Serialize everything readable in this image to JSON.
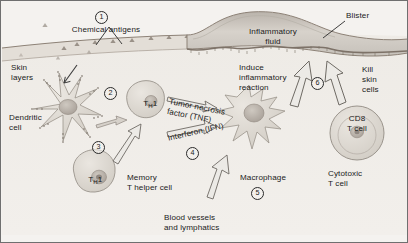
{
  "figure": {
    "background_color": "#f4f2ef",
    "frame_color": "#6f6f6f"
  },
  "markers": [
    {
      "id": "marker-1",
      "label": "1"
    },
    {
      "id": "marker-2",
      "label": "2"
    },
    {
      "id": "marker-3",
      "label": "3"
    },
    {
      "id": "marker-4",
      "label": "4"
    },
    {
      "id": "marker-5",
      "label": "5"
    },
    {
      "id": "marker-6",
      "label": "6"
    }
  ],
  "labels": {
    "chemical_antigens": "Chemical antigens",
    "skin_layers_l1": "Skin",
    "skin_layers_l2": "layers",
    "dendritic_cell_l1": "Dendritic",
    "dendritic_cell_l2": "cell",
    "th1_cell_upper": "T",
    "th1_cell_upper_sub": "H",
    "th1_cell_upper_num": "1",
    "th1_cell_lower": "T",
    "th1_cell_lower_sub": "H",
    "th1_cell_lower_num": "1",
    "memory_t_helper_l1": "Memory",
    "memory_t_helper_l2": "T helper cell",
    "tnf_l1": "Tumor necrosis",
    "tnf_l2": "factor (TNF)",
    "ifn": "Interferon (IFN)",
    "macrophage": "Macrophage",
    "blood_vessels_l1": "Blood vessels",
    "blood_vessels_l2": "and lymphatics",
    "induce_l1": "Induce",
    "induce_l2": "inflammatory",
    "induce_l3": "reaction",
    "inflammatory_fluid_l1": "Inflammatory",
    "inflammatory_fluid_l2": "fluid",
    "blister": "Blister",
    "kill_l1": "Kill",
    "kill_l2": "skin",
    "kill_l3": "cells",
    "cd8_l1": "CD8",
    "cd8_l2": "T cell",
    "cytotoxic_l1": "Cytotoxic",
    "cytotoxic_l2": "T cell"
  },
  "colors": {
    "ink": "#1b1b1b",
    "skin_fill": "#e3ded7",
    "skin_line": "#8d8277",
    "cell_fill": "#dedad3",
    "cell_stroke": "#9a948c",
    "nucleus": "#b9b2a9",
    "blister_fill": "#cfcac3",
    "arrow_fill": "#eceae6",
    "arrow_stroke": "#6e6a64"
  }
}
